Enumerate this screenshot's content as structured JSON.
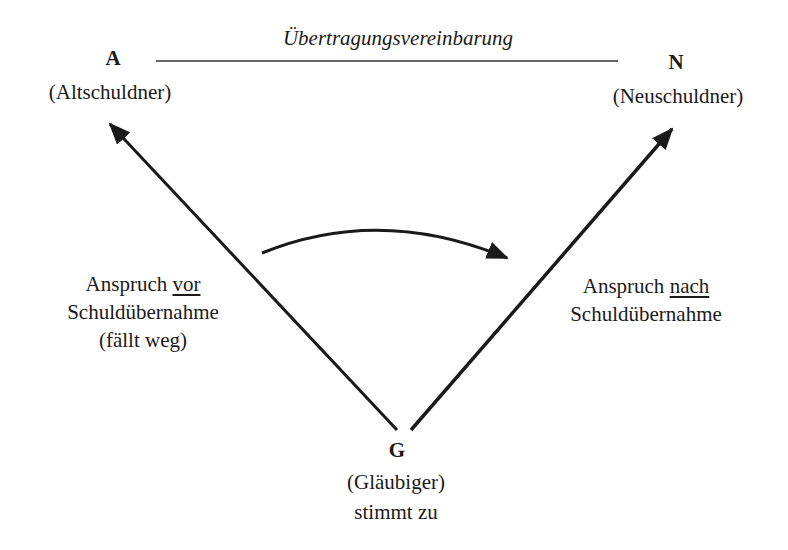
{
  "agreement": {
    "label": "Übertragungsvereinbarung"
  },
  "nodes": {
    "A": {
      "letter": "A",
      "role": "(Altschuldner)"
    },
    "N": {
      "letter": "N",
      "role": "(Neuschuldner)"
    },
    "G": {
      "letter": "G",
      "role": "(Gläubiger)",
      "note": "stimmt zu"
    }
  },
  "left_claim": {
    "prefix": "Anspruch ",
    "emphasis": "vor",
    "line2": "Schuldübernahme",
    "line3": "(fällt weg)"
  },
  "right_claim": {
    "prefix": "Anspruch ",
    "emphasis": "nach",
    "line2": "Schuldübernahme"
  },
  "arrows": [
    {
      "from": "G",
      "to": "A",
      "meaning": "claim before debt assumption"
    },
    {
      "from": "G",
      "to": "N",
      "meaning": "claim after debt assumption"
    },
    {
      "from": "left",
      "to": "right",
      "meaning": "transfer",
      "shape": "curved"
    }
  ],
  "colors": {
    "ink": "#1a1a1a",
    "background": "#ffffff"
  }
}
